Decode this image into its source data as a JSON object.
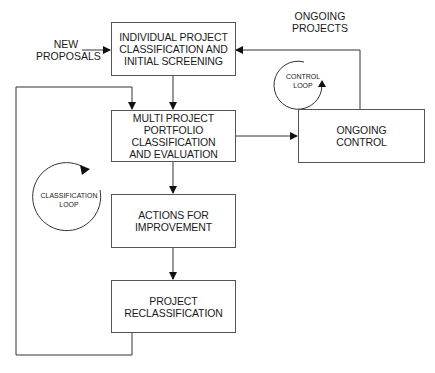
{
  "diagram": {
    "type": "flowchart",
    "inputs": {
      "new_proposals": [
        "NEW",
        "PROPOSALS"
      ],
      "ongoing_projects": [
        "ONGOING",
        "PROJECTS"
      ]
    },
    "boxes": [
      {
        "id": "screening",
        "lines": [
          "INDIVIDUAL PROJECT",
          "CLASSIFICATION AND",
          "INITIAL SCREENING"
        ]
      },
      {
        "id": "portfolio",
        "lines": [
          "MULTI PROJECT",
          "PORTFOLIO",
          "CLASSIFICATION",
          "AND EVALUATION"
        ]
      },
      {
        "id": "actions",
        "lines": [
          "ACTIONS FOR",
          "IMPROVEMENT"
        ]
      },
      {
        "id": "reclassification",
        "lines": [
          "PROJECT",
          "RECLASSIFICATION"
        ]
      },
      {
        "id": "ongoing_control",
        "lines": [
          "ONGOING",
          "CONTROL"
        ]
      }
    ],
    "loops": {
      "control": [
        "CONTROL",
        "LOOP"
      ],
      "classification": [
        "CLASSIFICATION",
        "LOOP"
      ]
    },
    "edges": [
      {
        "from": "new_proposals",
        "to": "screening"
      },
      {
        "from": "screening",
        "to": "portfolio"
      },
      {
        "from": "portfolio",
        "to": "actions"
      },
      {
        "from": "actions",
        "to": "reclassification"
      },
      {
        "from": "reclassification",
        "to": "portfolio",
        "label": "classification loop"
      },
      {
        "from": "portfolio",
        "to": "ongoing_control"
      },
      {
        "from": "ongoing_control",
        "to": "screening",
        "label": "control loop"
      }
    ],
    "colors": {
      "line": "#333333",
      "background": "#ffffff"
    }
  }
}
